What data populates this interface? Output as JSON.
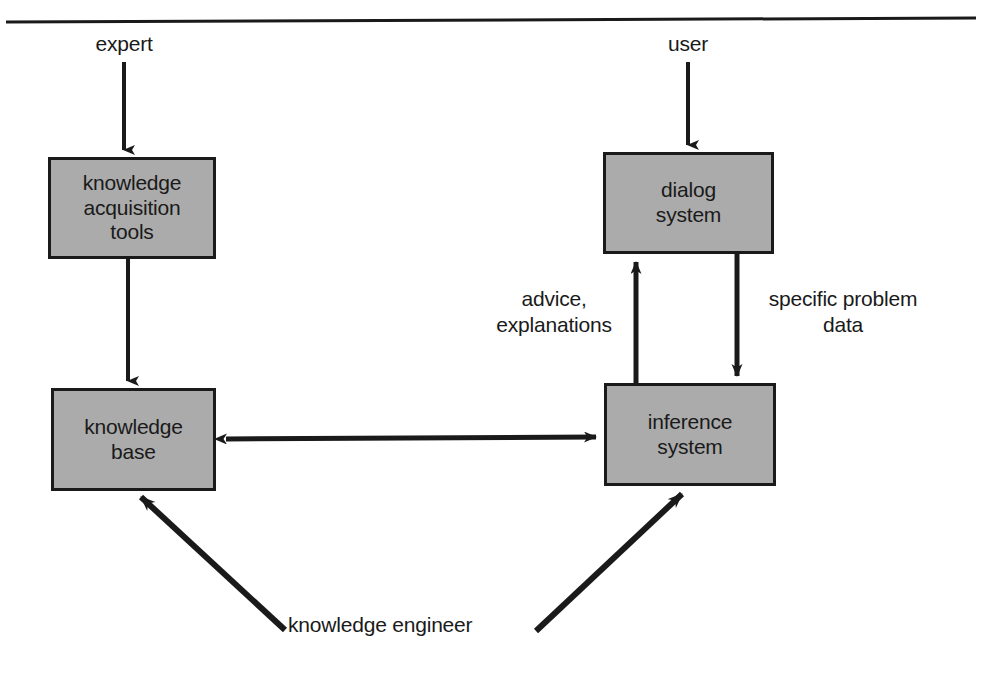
{
  "diagram": {
    "colors": {
      "box_fill": "#ababab",
      "box_stroke": "#1a1a1a",
      "arrow": "#1a1a1a",
      "rule": "#1a1a1a",
      "background": "#ffffff"
    },
    "top_rule": true,
    "actors": [
      {
        "id": "expert",
        "label": "expert"
      },
      {
        "id": "user",
        "label": "user"
      }
    ],
    "nodes": [
      {
        "id": "knowledge-acquisition-tools",
        "label": "knowledge\nacquisition\ntools"
      },
      {
        "id": "dialog-system",
        "label": "dialog\nsystem"
      },
      {
        "id": "knowledge-base",
        "label": "knowledge\nbase"
      },
      {
        "id": "inference-system",
        "label": "inference\nsystem"
      }
    ],
    "edge_labels": [
      {
        "id": "advice-explanations",
        "label": "advice,\nexplanations"
      },
      {
        "id": "specific-problem-data",
        "label": "specific problem\ndata"
      },
      {
        "id": "knowledge-engineer",
        "label": "knowledge engineer"
      }
    ],
    "edges": [
      {
        "from": "expert",
        "to": "knowledge-acquisition-tools",
        "style": "arrow-down"
      },
      {
        "from": "knowledge-acquisition-tools",
        "to": "knowledge-base",
        "style": "arrow-down"
      },
      {
        "from": "user",
        "to": "dialog-system",
        "style": "arrow-down"
      },
      {
        "from": "dialog-system",
        "to": "inference-system",
        "style": "arrow-down",
        "label": "specific-problem-data"
      },
      {
        "from": "inference-system",
        "to": "dialog-system",
        "style": "arrow-up",
        "label": "advice-explanations"
      },
      {
        "from": "inference-system",
        "to": "knowledge-base",
        "style": "arrow-bidirectional"
      },
      {
        "from": "knowledge-engineer",
        "to": "knowledge-base",
        "style": "arrow-diagonal-up-left"
      },
      {
        "from": "knowledge-engineer",
        "to": "inference-system",
        "style": "arrow-diagonal-up-right"
      }
    ]
  }
}
